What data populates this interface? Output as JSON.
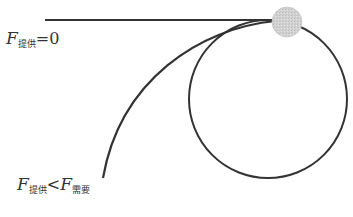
{
  "diagram": {
    "type": "physics-circular-motion",
    "colors": {
      "line": "#333333",
      "ball_fill": "#cfcfcf",
      "ball_stroke": "#bdbdbd",
      "background": "#ffffff"
    },
    "labels": {
      "zero": {
        "F1": "F",
        "sub1": "提供",
        "op": "=0"
      },
      "less": {
        "F1": "F",
        "sub1": "提供",
        "op": "<",
        "F2": "F",
        "sub2": "需要"
      }
    }
  }
}
